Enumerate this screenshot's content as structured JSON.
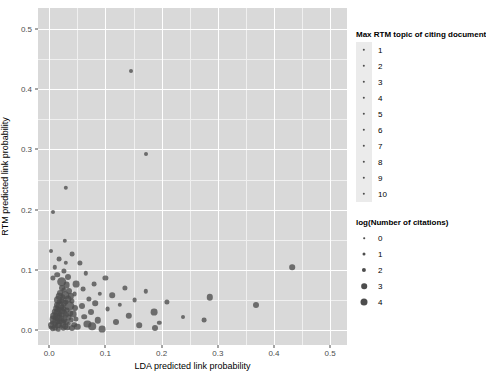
{
  "chart_data": {
    "type": "scatter",
    "title": "",
    "xlabel": "LDA predicted link probability",
    "ylabel": "RTM predicted link probability",
    "xlim": [
      -0.02,
      0.53
    ],
    "ylim": [
      -0.025,
      0.535
    ],
    "xticks": [
      0.0,
      0.1,
      0.2,
      0.3,
      0.4,
      0.5
    ],
    "xticklabels": [
      "0.0",
      "0.1",
      "0.2",
      "0.3",
      "0.4",
      "0.5"
    ],
    "yticks": [
      0.0,
      0.1,
      0.2,
      0.3,
      0.4,
      0.5
    ],
    "yticklabels": [
      "0.0",
      "0.1",
      "0.2",
      "0.3",
      "0.4",
      "0.5"
    ],
    "grid": true,
    "grid_minor": true,
    "panel_background": "#d9d9d9",
    "grid_color": "#ffffff",
    "point_color": "#4d4d4d",
    "legend_position": "right",
    "points": [
      {
        "x": 0.003,
        "y": 0.004,
        "s": 2.4
      },
      {
        "x": 0.004,
        "y": 0.008,
        "s": 3.0
      },
      {
        "x": 0.005,
        "y": 0.012,
        "s": 2.2
      },
      {
        "x": 0.006,
        "y": 0.002,
        "s": 2.8
      },
      {
        "x": 0.007,
        "y": 0.018,
        "s": 3.4
      },
      {
        "x": 0.008,
        "y": 0.006,
        "s": 2.0
      },
      {
        "x": 0.009,
        "y": 0.024,
        "s": 3.8
      },
      {
        "x": 0.01,
        "y": 0.01,
        "s": 2.6
      },
      {
        "x": 0.01,
        "y": 0.03,
        "s": 3.2
      },
      {
        "x": 0.011,
        "y": 0.003,
        "s": 2.2
      },
      {
        "x": 0.012,
        "y": 0.016,
        "s": 3.6
      },
      {
        "x": 0.012,
        "y": 0.036,
        "s": 2.8
      },
      {
        "x": 0.013,
        "y": 0.022,
        "s": 4.2
      },
      {
        "x": 0.013,
        "y": 0.007,
        "s": 2.4
      },
      {
        "x": 0.014,
        "y": 0.042,
        "s": 3.0
      },
      {
        "x": 0.014,
        "y": 0.028,
        "s": 3.4
      },
      {
        "x": 0.015,
        "y": 0.013,
        "s": 2.6
      },
      {
        "x": 0.015,
        "y": 0.05,
        "s": 4.0
      },
      {
        "x": 0.016,
        "y": 0.034,
        "s": 2.8
      },
      {
        "x": 0.016,
        "y": 0.001,
        "s": 2.2
      },
      {
        "x": 0.017,
        "y": 0.02,
        "s": 3.6
      },
      {
        "x": 0.017,
        "y": 0.046,
        "s": 2.4
      },
      {
        "x": 0.018,
        "y": 0.009,
        "s": 3.0
      },
      {
        "x": 0.018,
        "y": 0.056,
        "s": 3.2
      },
      {
        "x": 0.019,
        "y": 0.026,
        "s": 2.6
      },
      {
        "x": 0.019,
        "y": 0.04,
        "s": 4.4
      },
      {
        "x": 0.02,
        "y": 0.014,
        "s": 2.8
      },
      {
        "x": 0.02,
        "y": 0.062,
        "s": 3.0
      },
      {
        "x": 0.021,
        "y": 0.032,
        "s": 3.8
      },
      {
        "x": 0.021,
        "y": 0.005,
        "s": 2.2
      },
      {
        "x": 0.022,
        "y": 0.048,
        "s": 2.6
      },
      {
        "x": 0.022,
        "y": 0.019,
        "s": 3.4
      },
      {
        "x": 0.023,
        "y": 0.07,
        "s": 3.0
      },
      {
        "x": 0.023,
        "y": 0.038,
        "s": 2.4
      },
      {
        "x": 0.024,
        "y": 0.011,
        "s": 3.6
      },
      {
        "x": 0.024,
        "y": 0.054,
        "s": 2.8
      },
      {
        "x": 0.025,
        "y": 0.029,
        "s": 4.0
      },
      {
        "x": 0.025,
        "y": 0.002,
        "s": 2.2
      },
      {
        "x": 0.026,
        "y": 0.044,
        "s": 3.2
      },
      {
        "x": 0.026,
        "y": 0.066,
        "s": 2.6
      },
      {
        "x": 0.027,
        "y": 0.017,
        "s": 3.0
      },
      {
        "x": 0.027,
        "y": 0.035,
        "s": 2.4
      },
      {
        "x": 0.028,
        "y": 0.058,
        "s": 3.8
      },
      {
        "x": 0.028,
        "y": 0.006,
        "s": 2.8
      },
      {
        "x": 0.029,
        "y": 0.025,
        "s": 3.2
      },
      {
        "x": 0.03,
        "y": 0.046,
        "s": 2.6
      },
      {
        "x": 0.03,
        "y": 0.014,
        "s": 3.0
      },
      {
        "x": 0.031,
        "y": 0.074,
        "s": 3.4
      },
      {
        "x": 0.032,
        "y": 0.033,
        "s": 2.4
      },
      {
        "x": 0.032,
        "y": 0.004,
        "s": 2.8
      },
      {
        "x": 0.033,
        "y": 0.052,
        "s": 3.6
      },
      {
        "x": 0.034,
        "y": 0.021,
        "s": 2.6
      },
      {
        "x": 0.035,
        "y": 0.064,
        "s": 3.0
      },
      {
        "x": 0.035,
        "y": 0.01,
        "s": 2.2
      },
      {
        "x": 0.036,
        "y": 0.04,
        "s": 4.6
      },
      {
        "x": 0.037,
        "y": 0.028,
        "s": 2.8
      },
      {
        "x": 0.038,
        "y": 0.056,
        "s": 3.2
      },
      {
        "x": 0.039,
        "y": 0.016,
        "s": 2.4
      },
      {
        "x": 0.04,
        "y": 0.003,
        "s": 3.0
      },
      {
        "x": 0.041,
        "y": 0.048,
        "s": 2.6
      },
      {
        "x": 0.042,
        "y": 0.026,
        "s": 3.4
      },
      {
        "x": 0.044,
        "y": 0.009,
        "s": 2.8
      },
      {
        "x": 0.045,
        "y": 0.06,
        "s": 2.4
      },
      {
        "x": 0.046,
        "y": 0.036,
        "s": 3.0
      },
      {
        "x": 0.048,
        "y": 0.018,
        "s": 2.6
      },
      {
        "x": 0.05,
        "y": 0.005,
        "s": 3.2
      },
      {
        "x": 0.006,
        "y": 0.086,
        "s": 2.6
      },
      {
        "x": 0.01,
        "y": 0.104,
        "s": 2.2
      },
      {
        "x": 0.014,
        "y": 0.092,
        "s": 2.8
      },
      {
        "x": 0.018,
        "y": 0.118,
        "s": 2.4
      },
      {
        "x": 0.022,
        "y": 0.08,
        "s": 4.8
      },
      {
        "x": 0.026,
        "y": 0.098,
        "s": 2.6
      },
      {
        "x": 0.03,
        "y": 0.112,
        "s": 2.2
      },
      {
        "x": 0.034,
        "y": 0.088,
        "s": 3.0
      },
      {
        "x": 0.04,
        "y": 0.126,
        "s": 2.4
      },
      {
        "x": 0.048,
        "y": 0.076,
        "s": 3.4
      },
      {
        "x": 0.004,
        "y": 0.132,
        "s": 2.0
      },
      {
        "x": 0.028,
        "y": 0.148,
        "s": 2.2
      },
      {
        "x": 0.055,
        "y": 0.112,
        "s": 2.6
      },
      {
        "x": 0.058,
        "y": 0.04,
        "s": 3.0
      },
      {
        "x": 0.06,
        "y": 0.068,
        "s": 2.4
      },
      {
        "x": 0.062,
        "y": 0.022,
        "s": 2.8
      },
      {
        "x": 0.065,
        "y": 0.094,
        "s": 2.2
      },
      {
        "x": 0.068,
        "y": 0.01,
        "s": 3.6
      },
      {
        "x": 0.07,
        "y": 0.052,
        "s": 2.6
      },
      {
        "x": 0.074,
        "y": 0.03,
        "s": 3.0
      },
      {
        "x": 0.076,
        "y": 0.006,
        "s": 3.8
      },
      {
        "x": 0.08,
        "y": 0.076,
        "s": 2.4
      },
      {
        "x": 0.082,
        "y": 0.044,
        "s": 2.8
      },
      {
        "x": 0.086,
        "y": 0.016,
        "s": 3.2
      },
      {
        "x": 0.09,
        "y": 0.06,
        "s": 2.2
      },
      {
        "x": 0.094,
        "y": 0.002,
        "s": 3.4
      },
      {
        "x": 0.1,
        "y": 0.086,
        "s": 2.6
      },
      {
        "x": 0.104,
        "y": 0.034,
        "s": 2.4
      },
      {
        "x": 0.112,
        "y": 0.058,
        "s": 2.8
      },
      {
        "x": 0.118,
        "y": 0.014,
        "s": 3.0
      },
      {
        "x": 0.126,
        "y": 0.042,
        "s": 2.2
      },
      {
        "x": 0.134,
        "y": 0.07,
        "s": 2.6
      },
      {
        "x": 0.142,
        "y": 0.024,
        "s": 3.2
      },
      {
        "x": 0.152,
        "y": 0.05,
        "s": 2.4
      },
      {
        "x": 0.16,
        "y": 0.008,
        "s": 2.8
      },
      {
        "x": 0.172,
        "y": 0.064,
        "s": 2.2
      },
      {
        "x": 0.186,
        "y": 0.03,
        "s": 3.4
      },
      {
        "x": 0.188,
        "y": 0.004,
        "s": 3.0
      },
      {
        "x": 0.196,
        "y": 0.012,
        "s": 2.2
      },
      {
        "x": 0.21,
        "y": 0.046,
        "s": 2.6
      },
      {
        "x": 0.238,
        "y": 0.022,
        "s": 2.0
      },
      {
        "x": 0.276,
        "y": 0.016,
        "s": 2.4
      },
      {
        "x": 0.286,
        "y": 0.054,
        "s": 3.2
      },
      {
        "x": 0.368,
        "y": 0.042,
        "s": 3.0
      },
      {
        "x": 0.432,
        "y": 0.104,
        "s": 2.8
      },
      {
        "x": 0.146,
        "y": 0.43,
        "s": 2.0
      },
      {
        "x": 0.172,
        "y": 0.292,
        "s": 2.0
      },
      {
        "x": 0.006,
        "y": 0.196,
        "s": 2.0
      },
      {
        "x": 0.03,
        "y": 0.236,
        "s": 2.2
      }
    ],
    "legends": [
      {
        "name": "color-legend",
        "title": "Max RTM topic of citing document",
        "items": [
          {
            "label": "1"
          },
          {
            "label": "2"
          },
          {
            "label": "3"
          },
          {
            "label": "4"
          },
          {
            "label": "5"
          },
          {
            "label": "6"
          },
          {
            "label": "7"
          },
          {
            "label": "8"
          },
          {
            "label": "9"
          },
          {
            "label": "10"
          }
        ]
      },
      {
        "name": "size-legend",
        "title": "log(Number of citations)",
        "items": [
          {
            "label": "0",
            "size": 1.6
          },
          {
            "label": "1",
            "size": 3.0
          },
          {
            "label": "2",
            "size": 4.2
          },
          {
            "label": "3",
            "size": 5.6
          },
          {
            "label": "4",
            "size": 7.0
          }
        ]
      }
    ]
  }
}
